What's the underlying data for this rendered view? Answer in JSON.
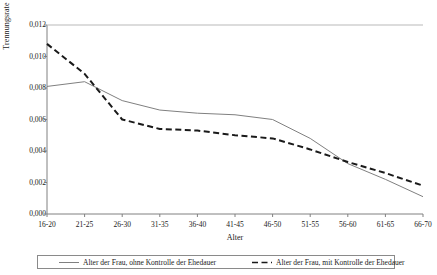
{
  "chart_data": {
    "type": "line",
    "title": "",
    "xlabel": "Alter",
    "ylabel": "Trennungsrate",
    "categories": [
      "16-20",
      "21-25",
      "26-30",
      "31-35",
      "36-40",
      "41-45",
      "46-50",
      "51-55",
      "56-60",
      "61-65",
      "66-70"
    ],
    "ylim": [
      0,
      0.012
    ],
    "yticks": [
      0,
      0.002,
      0.004,
      0.006,
      0.008,
      0.01,
      0.012
    ],
    "ytick_labels": [
      "0,000",
      "0,002",
      "0,004",
      "0,006",
      "0,008",
      "0,010",
      "0,012"
    ],
    "grid": false,
    "legend_position": "bottom",
    "series": [
      {
        "name": "Alter der Frau, ohne Kontrolle der Ehedauer",
        "style": "solid",
        "color": "#808080",
        "values": [
          0.0081,
          0.0084,
          0.0072,
          0.0066,
          0.0064,
          0.0063,
          0.006,
          0.0048,
          0.0032,
          0.0022,
          0.0011
        ]
      },
      {
        "name": "Alter der Frau, mit Kontrolle der Ehedauer",
        "style": "dashed",
        "color": "#1a1a1a",
        "values": [
          0.0108,
          0.0089,
          0.006,
          0.0054,
          0.0053,
          0.005,
          0.0048,
          0.0041,
          0.0033,
          0.0026,
          0.0018
        ]
      }
    ]
  },
  "axes": {
    "y_title": "Trennungsrate",
    "x_title": "Alter"
  },
  "legend": {
    "entries": [
      {
        "label": "Alter der Frau, ohne Kontrolle der Ehedauer"
      },
      {
        "label": "Alter der Frau, mit Kontrolle der Ehedauer"
      }
    ]
  },
  "colors": {
    "series_solid": "#808080",
    "series_dashed": "#1a1a1a",
    "axis": "#808080",
    "legend_border": "#8a8a8a",
    "background": "#ffffff"
  }
}
